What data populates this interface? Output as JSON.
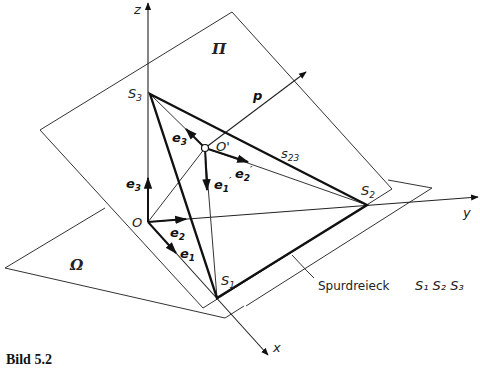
{
  "diagram": {
    "axes": {
      "x": "x",
      "y": "y",
      "z": "z"
    },
    "origin": "O",
    "origin_prime": "O'",
    "planes": {
      "pi": "Π",
      "omega": "Ω"
    },
    "points": {
      "s1": "S",
      "s1_sub": "1",
      "s2": "S",
      "s2_sub": "2",
      "s3": "S",
      "s3_sub": "3"
    },
    "edge_label": {
      "main": "s",
      "sub": "23"
    },
    "normal_vector": "p",
    "base_vectors": [
      {
        "id": "e1",
        "main": "e",
        "sub": "1"
      },
      {
        "id": "e2",
        "main": "e",
        "sub": "2"
      },
      {
        "id": "e3",
        "main": "e",
        "sub": "3"
      }
    ],
    "prime_vectors": [
      {
        "id": "e1p",
        "main": "e",
        "sub": "1",
        "prime": "′"
      },
      {
        "id": "e2p",
        "main": "e",
        "sub": "2",
        "prime": "′"
      },
      {
        "id": "e3p",
        "main": "e",
        "sub": "3",
        "prime": "′"
      }
    ],
    "callout": {
      "text": "Spurdreieck",
      "points": "S₁ S₂ S₃"
    }
  },
  "caption": "Bild 5.2"
}
